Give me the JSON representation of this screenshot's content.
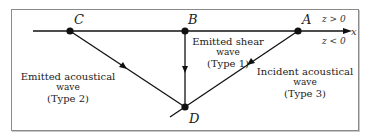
{
  "diagram": {
    "points": {
      "A": {
        "label": "A",
        "x": 298,
        "y": 31
      },
      "B": {
        "label": "B",
        "x": 185,
        "y": 31
      },
      "C": {
        "label": "C",
        "x": 70,
        "y": 31
      },
      "D": {
        "label": "D",
        "x": 185,
        "y": 107
      }
    },
    "axis": {
      "name": "x",
      "region_above": "z > 0",
      "region_below": "z < 0"
    },
    "waves": [
      {
        "id": "shear",
        "from": "B",
        "to": "D",
        "line1": "Emitted shear",
        "line2": "wave",
        "line3": "(Type 1)"
      },
      {
        "id": "emitted-acoustical",
        "from": "C",
        "to": "D",
        "line1": "Emitted acoustical",
        "line2": "wave",
        "line3": "(Type 2)"
      },
      {
        "id": "incident-acoustical",
        "from": "A",
        "to": "D",
        "line1": "Incident acoustical",
        "line2": "wave",
        "line3": "(Type 3)"
      }
    ],
    "colors": {
      "line": "#111111",
      "frame": "#8a8a8a",
      "text": "#222222"
    }
  }
}
